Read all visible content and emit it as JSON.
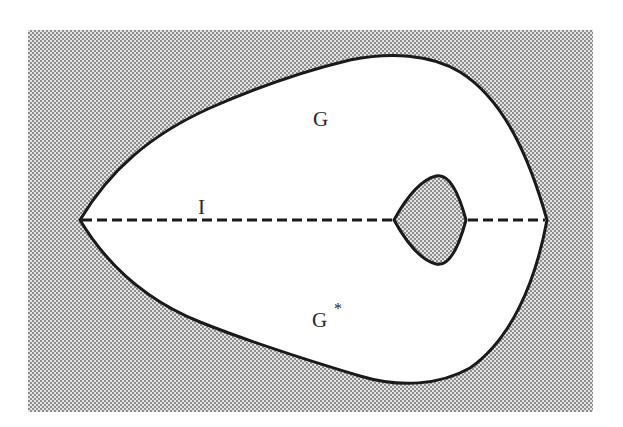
{
  "figure": {
    "regions": {
      "upper_region_label": "G",
      "lower_region_label": "G",
      "lower_region_superscript": "*",
      "interval_label": "I"
    },
    "elements": [
      {
        "name": "outer-boundary",
        "description": "closed curve with cusps at left and right on the dashed axis"
      },
      {
        "name": "inner-hole",
        "description": "small shaded region bounded by curve with cusps on the dashed axis"
      },
      {
        "name": "symmetry-axis",
        "description": "dashed horizontal line segment I"
      }
    ],
    "colors": {
      "stipple_dark": "#8c8c8c",
      "stipple_light": "#e6e6e6",
      "interior": "#ffffff",
      "stroke": "#1a1a1a"
    }
  }
}
